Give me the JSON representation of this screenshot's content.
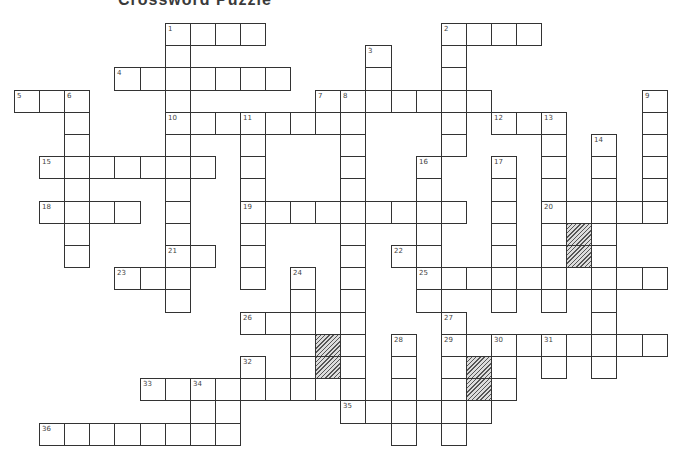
{
  "title": "Crossword Puzzle",
  "grid": {
    "origin_x": 14,
    "origin_y": 23,
    "cell_w": 25.1,
    "cell_h": 22.2,
    "border_color": "#333333",
    "block_color": "#777777",
    "rows": [
      {
        "r": 0,
        "cells": [
          [
            6,
            "1"
          ],
          [
            7
          ],
          [
            8
          ],
          [
            9
          ],
          [
            17,
            "2"
          ],
          [
            18
          ],
          [
            19
          ],
          [
            20
          ]
        ]
      },
      {
        "r": 1,
        "cells": [
          [
            6
          ],
          [
            14,
            "3"
          ],
          [
            17
          ]
        ]
      },
      {
        "r": 2,
        "cells": [
          [
            4,
            "4"
          ],
          [
            5
          ],
          [
            6
          ],
          [
            7
          ],
          [
            8
          ],
          [
            9
          ],
          [
            10
          ],
          [
            14
          ],
          [
            17
          ]
        ]
      },
      {
        "r": 3,
        "cells": [
          [
            0,
            "5"
          ],
          [
            1
          ],
          [
            2,
            "6"
          ],
          [
            6
          ],
          [
            12,
            "7"
          ],
          [
            13,
            "8"
          ],
          [
            14
          ],
          [
            15
          ],
          [
            16
          ],
          [
            17
          ],
          [
            18
          ],
          [
            25,
            "9"
          ]
        ]
      },
      {
        "r": 4,
        "cells": [
          [
            2
          ],
          [
            6,
            "10"
          ],
          [
            7
          ],
          [
            8
          ],
          [
            9,
            "11"
          ],
          [
            10
          ],
          [
            11
          ],
          [
            12
          ],
          [
            13
          ],
          [
            17
          ],
          [
            19,
            "12"
          ],
          [
            20
          ],
          [
            21,
            "13"
          ],
          [
            25
          ]
        ]
      },
      {
        "r": 5,
        "cells": [
          [
            2
          ],
          [
            6
          ],
          [
            9
          ],
          [
            13
          ],
          [
            17
          ],
          [
            21
          ],
          [
            23,
            "14"
          ],
          [
            25
          ]
        ]
      },
      {
        "r": 6,
        "cells": [
          [
            1,
            "15"
          ],
          [
            2
          ],
          [
            3
          ],
          [
            4
          ],
          [
            5
          ],
          [
            6
          ],
          [
            7
          ],
          [
            9
          ],
          [
            13
          ],
          [
            16,
            "16"
          ],
          [
            19,
            "17"
          ],
          [
            21
          ],
          [
            23
          ],
          [
            25
          ]
        ]
      },
      {
        "r": 7,
        "cells": [
          [
            2
          ],
          [
            6
          ],
          [
            9
          ],
          [
            13
          ],
          [
            16
          ],
          [
            19
          ],
          [
            21
          ],
          [
            23
          ],
          [
            25
          ]
        ]
      },
      {
        "r": 8,
        "cells": [
          [
            1,
            "18"
          ],
          [
            2
          ],
          [
            3
          ],
          [
            4
          ],
          [
            6
          ],
          [
            9,
            "19"
          ],
          [
            10
          ],
          [
            11
          ],
          [
            12
          ],
          [
            13
          ],
          [
            14
          ],
          [
            15
          ],
          [
            16
          ],
          [
            17
          ],
          [
            19
          ],
          [
            21,
            "20"
          ],
          [
            22
          ],
          [
            23
          ],
          [
            24
          ],
          [
            25
          ]
        ]
      },
      {
        "r": 9,
        "cells": [
          [
            2
          ],
          [
            6
          ],
          [
            9
          ],
          [
            13
          ],
          [
            16
          ],
          [
            19
          ],
          [
            21
          ],
          [
            22,
            null,
            "block"
          ],
          [
            23
          ]
        ]
      },
      {
        "r": 10,
        "cells": [
          [
            2
          ],
          [
            6,
            "21"
          ],
          [
            7
          ],
          [
            9
          ],
          [
            13
          ],
          [
            15,
            "22"
          ],
          [
            16
          ],
          [
            19
          ],
          [
            21
          ],
          [
            22,
            null,
            "block"
          ],
          [
            23
          ]
        ]
      },
      {
        "r": 11,
        "cells": [
          [
            4,
            "23"
          ],
          [
            5
          ],
          [
            6
          ],
          [
            9
          ],
          [
            11,
            "24"
          ],
          [
            13
          ],
          [
            16,
            "25"
          ],
          [
            17
          ],
          [
            18
          ],
          [
            19
          ],
          [
            20
          ],
          [
            21
          ],
          [
            22
          ],
          [
            23
          ],
          [
            24
          ],
          [
            25
          ]
        ]
      },
      {
        "r": 12,
        "cells": [
          [
            6
          ],
          [
            11
          ],
          [
            13
          ],
          [
            16
          ],
          [
            19
          ],
          [
            21
          ],
          [
            23
          ]
        ]
      },
      {
        "r": 13,
        "cells": [
          [
            9,
            "26"
          ],
          [
            10
          ],
          [
            11
          ],
          [
            12
          ],
          [
            13
          ],
          [
            17,
            "27"
          ],
          [
            23
          ]
        ]
      },
      {
        "r": 14,
        "cells": [
          [
            11
          ],
          [
            12,
            null,
            "block"
          ],
          [
            13
          ],
          [
            15,
            "28"
          ],
          [
            17,
            "29"
          ],
          [
            18
          ],
          [
            19,
            "30"
          ],
          [
            20
          ],
          [
            21,
            "31"
          ],
          [
            22
          ],
          [
            23
          ],
          [
            24
          ],
          [
            25
          ]
        ]
      },
      {
        "r": 15,
        "cells": [
          [
            9,
            "32"
          ],
          [
            11
          ],
          [
            12,
            null,
            "block"
          ],
          [
            13
          ],
          [
            15
          ],
          [
            17
          ],
          [
            18,
            null,
            "block"
          ],
          [
            19
          ],
          [
            21
          ],
          [
            23
          ]
        ]
      },
      {
        "r": 16,
        "cells": [
          [
            5,
            "33"
          ],
          [
            6
          ],
          [
            7,
            "34"
          ],
          [
            8
          ],
          [
            9
          ],
          [
            10
          ],
          [
            11
          ],
          [
            12
          ],
          [
            13
          ],
          [
            15
          ],
          [
            17
          ],
          [
            18,
            null,
            "block"
          ],
          [
            19
          ]
        ]
      },
      {
        "r": 17,
        "cells": [
          [
            7
          ],
          [
            8
          ],
          [
            13,
            "35"
          ],
          [
            14
          ],
          [
            15
          ],
          [
            16
          ],
          [
            17
          ],
          [
            18
          ]
        ]
      },
      {
        "r": 18,
        "cells": [
          [
            1,
            "36"
          ],
          [
            2
          ],
          [
            3
          ],
          [
            4
          ],
          [
            5
          ],
          [
            6
          ],
          [
            7
          ],
          [
            8
          ],
          [
            15
          ],
          [
            17
          ]
        ]
      }
    ]
  },
  "clue_numbers": [
    "1",
    "2",
    "3",
    "4",
    "5",
    "6",
    "7",
    "8",
    "9",
    "10",
    "11",
    "12",
    "13",
    "14",
    "15",
    "16",
    "17",
    "18",
    "19",
    "20",
    "21",
    "22",
    "23",
    "24",
    "25",
    "26",
    "27",
    "28",
    "29",
    "30",
    "31",
    "32",
    "33",
    "34",
    "35",
    "36"
  ]
}
